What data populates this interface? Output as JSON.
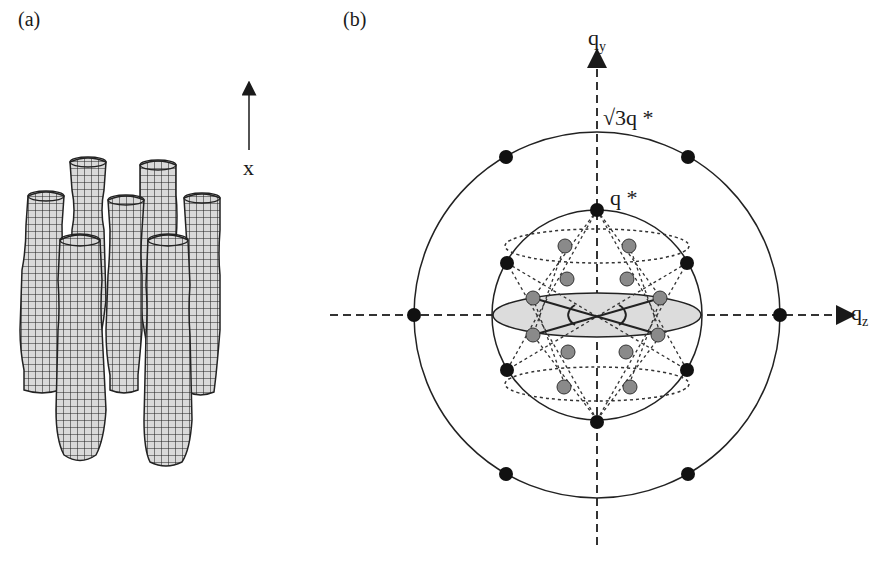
{
  "panels": {
    "a": {
      "label": "(a)",
      "axis_label": "x",
      "description": "Array of undulating modulated cylinders (wireframe mesh), hexagonally packed, oriented along x"
    },
    "b": {
      "label": "(b)",
      "qy_label": "q",
      "qy_sub": "y",
      "qz_label": "q",
      "qz_sub": "z",
      "outer_ring_label": "√3q *",
      "inner_ring_label": "q *",
      "description": "Reciprocal space diagram: outer circle radius √3q*, inner sphere radius q* with black and gray Bragg peaks"
    }
  },
  "colors": {
    "line": "#2a2a2a",
    "dot_black": "#111111",
    "dot_gray": "#8a8a8a",
    "ellipse_fill": "#dcdcdc",
    "mesh": "#222222",
    "mesh_fill": "#d8d8d8"
  }
}
